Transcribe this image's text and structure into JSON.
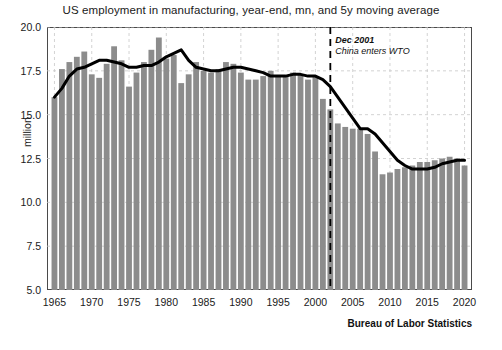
{
  "chart_data": {
    "type": "bar",
    "title": "US employment in manufacturing, year-end, mn, and 5y moving average",
    "xlabel": "",
    "ylabel": "million",
    "ylim": [
      5.0,
      20.0
    ],
    "xlim": [
      1964,
      2021
    ],
    "grid": true,
    "legend": "none",
    "y_ticks": [
      "5.0",
      "7.5",
      "10.0",
      "12.5",
      "15.0",
      "17.5",
      "20.0"
    ],
    "y_tick_values": [
      5.0,
      7.5,
      10.0,
      12.5,
      15.0,
      17.5,
      20.0
    ],
    "x_ticks": [
      "1965",
      "1970",
      "1975",
      "1980",
      "1985",
      "1990",
      "1995",
      "2000",
      "2005",
      "2010",
      "2015",
      "2020"
    ],
    "x_tick_values": [
      1965,
      1970,
      1975,
      1980,
      1985,
      1990,
      1995,
      2000,
      2005,
      2010,
      2015,
      2020
    ],
    "bar_color": "#8c8c8c",
    "line_color": "#000000",
    "annotation_line_color": "#000000",
    "series": [
      {
        "name": "US manufacturing employment (year-end, millions)",
        "type": "bar",
        "x": [
          1965,
          1966,
          1967,
          1968,
          1969,
          1970,
          1971,
          1972,
          1973,
          1974,
          1975,
          1976,
          1977,
          1978,
          1979,
          1980,
          1981,
          1982,
          1983,
          1984,
          1985,
          1986,
          1987,
          1988,
          1989,
          1990,
          1991,
          1992,
          1993,
          1994,
          1995,
          1996,
          1997,
          1998,
          1999,
          2000,
          2001,
          2002,
          2003,
          2004,
          2005,
          2006,
          2007,
          2008,
          2009,
          2010,
          2011,
          2012,
          2013,
          2014,
          2015,
          2016,
          2017,
          2018,
          2019,
          2020
        ],
        "values": [
          16.0,
          17.6,
          18.0,
          18.3,
          18.6,
          17.3,
          17.1,
          17.9,
          18.9,
          18.1,
          16.6,
          17.4,
          18.0,
          18.7,
          19.4,
          18.2,
          18.4,
          16.8,
          17.3,
          18.0,
          17.5,
          17.4,
          17.6,
          18.0,
          17.9,
          17.4,
          17.0,
          17.0,
          17.2,
          17.5,
          17.2,
          17.2,
          17.4,
          17.3,
          17.0,
          17.2,
          15.9,
          15.3,
          14.5,
          14.3,
          14.2,
          14.2,
          13.9,
          12.9,
          11.6,
          11.7,
          11.9,
          12.0,
          12.1,
          12.3,
          12.3,
          12.4,
          12.5,
          12.6,
          12.5,
          12.1
        ]
      },
      {
        "name": "5y moving average",
        "type": "line",
        "x": [
          1965,
          1966,
          1967,
          1968,
          1969,
          1970,
          1971,
          1972,
          1973,
          1974,
          1975,
          1976,
          1977,
          1978,
          1979,
          1980,
          1981,
          1982,
          1983,
          1984,
          1985,
          1986,
          1987,
          1988,
          1989,
          1990,
          1991,
          1992,
          1993,
          1994,
          1995,
          1996,
          1997,
          1998,
          1999,
          2000,
          2001,
          2002,
          2003,
          2004,
          2005,
          2006,
          2007,
          2008,
          2009,
          2010,
          2011,
          2012,
          2013,
          2014,
          2015,
          2016,
          2017,
          2018,
          2019,
          2020
        ],
        "values": [
          16.0,
          16.5,
          17.2,
          17.6,
          17.7,
          17.9,
          18.1,
          18.1,
          18.0,
          17.9,
          17.7,
          17.7,
          17.8,
          17.8,
          18.0,
          18.3,
          18.5,
          18.7,
          18.1,
          17.7,
          17.6,
          17.5,
          17.5,
          17.6,
          17.7,
          17.7,
          17.6,
          17.5,
          17.4,
          17.2,
          17.2,
          17.2,
          17.3,
          17.3,
          17.2,
          17.2,
          17.0,
          16.6,
          16.0,
          15.4,
          14.8,
          14.2,
          14.2,
          13.9,
          13.4,
          12.9,
          12.4,
          12.1,
          11.9,
          11.9,
          11.9,
          12.0,
          12.2,
          12.3,
          12.4,
          12.4
        ]
      }
    ],
    "annotation": {
      "line1": "Dec 2001",
      "line2": "China enters WTO",
      "x_value": 2002,
      "style": "vertical dashed line"
    },
    "source": "Bureau of Labor Statistics"
  }
}
